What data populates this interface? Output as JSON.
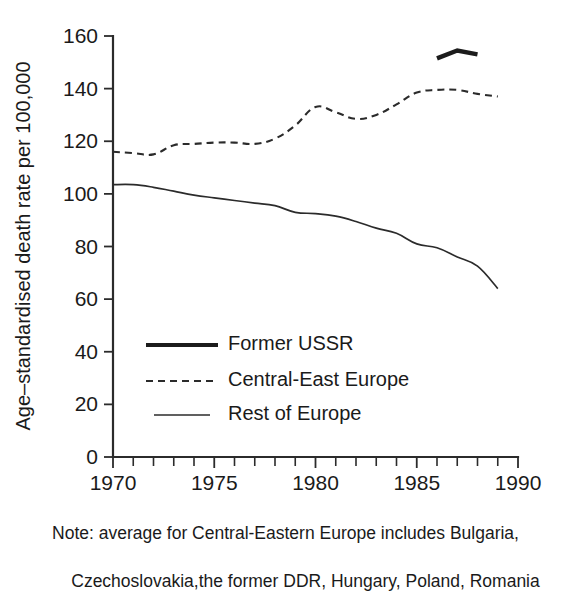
{
  "chart_data": {
    "type": "line",
    "title": "",
    "xlabel": "",
    "ylabel": "Age–standardised death rate per 100,000",
    "xlim": [
      1970,
      1990
    ],
    "ylim": [
      0,
      160
    ],
    "grid": false,
    "legend_position": "center-left-inside",
    "y_ticks": [
      0,
      20,
      40,
      60,
      80,
      100,
      120,
      140,
      160
    ],
    "y_tick_labels": [
      "0",
      "20",
      "40",
      "60",
      "80",
      "100",
      "120",
      "140",
      "160"
    ],
    "x_ticks": [
      1970,
      1975,
      1980,
      1985,
      1990
    ],
    "x_tick_labels": [
      "1970",
      "1975",
      "1980",
      "1985",
      "1990"
    ],
    "x_minor_ticks": [
      1971,
      1972,
      1973,
      1974,
      1976,
      1977,
      1978,
      1979,
      1981,
      1982,
      1983,
      1984,
      1986,
      1987,
      1988,
      1989
    ],
    "series": [
      {
        "name": "Former USSR",
        "style": "solid-thick",
        "x": [
          1986,
          1987,
          1988
        ],
        "values": [
          151.5,
          154.5,
          153.0
        ]
      },
      {
        "name": "Central-East Europe",
        "style": "dashed",
        "x": [
          1970,
          1971,
          1972,
          1973,
          1974,
          1975,
          1976,
          1977,
          1978,
          1979,
          1980,
          1981,
          1982,
          1983,
          1984,
          1985,
          1986,
          1987,
          1988,
          1989
        ],
        "values": [
          116,
          115.5,
          115,
          118.5,
          119,
          119.5,
          119.5,
          119,
          121,
          126,
          133,
          131,
          128.5,
          130,
          134,
          138.5,
          139.5,
          139.5,
          138,
          137
        ]
      },
      {
        "name": "Rest of Europe",
        "style": "solid-thin",
        "x": [
          1970,
          1971,
          1972,
          1973,
          1974,
          1975,
          1976,
          1977,
          1978,
          1979,
          1980,
          1981,
          1982,
          1983,
          1984,
          1985,
          1986,
          1987,
          1988,
          1989
        ],
        "values": [
          103.5,
          103.5,
          102.5,
          101,
          99.5,
          98.5,
          97.5,
          96.5,
          95.5,
          93,
          92.5,
          91.5,
          89.5,
          87,
          85,
          81,
          79.5,
          76,
          72.5,
          64
        ]
      }
    ]
  },
  "legend": {
    "items": [
      {
        "label": "Former USSR",
        "style": "solid-thick"
      },
      {
        "label": "Central-East Europe",
        "style": "dashed"
      },
      {
        "label": "Rest of Europe",
        "style": "solid-thin"
      }
    ]
  },
  "note": {
    "line1": "Note: average for Central-Eastern Europe includes Bulgaria,",
    "line2": "Czechoslovakia,the former DDR, Hungary, Poland, Romania"
  },
  "colors": {
    "ink": "#1a1a1a",
    "axis": "#2b2b2b",
    "background": "#ffffff"
  }
}
